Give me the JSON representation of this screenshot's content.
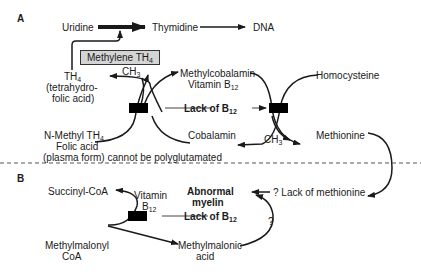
{
  "panel_a": {
    "label": "A",
    "uridine": "Uridine",
    "thymidine": "Thymidine",
    "dna": "DNA",
    "methylene_box": {
      "text": "Methylene TH",
      "sub": "4"
    },
    "th4": {
      "text": "TH",
      "sub": "4"
    },
    "th4_desc_1": "(tetrahydro-",
    "th4_desc_2": "folic acid)",
    "ch3_top": {
      "text": "CH",
      "sub": "3"
    },
    "methylcobalamin": "Methylcobalamin",
    "vitamin_b12": {
      "text": "Vitamin B",
      "sub": "12"
    },
    "homocysteine": "Homocysteine",
    "lack_b12": {
      "text": "Lack of B",
      "sub": "12"
    },
    "n_methyl": {
      "text": "N-Methyl TH",
      "sub": "4"
    },
    "folic_acid": "Folic acid",
    "plasma_form": "(plasma form) cannot be polyglutamated",
    "cobalamin": "Cobalamin",
    "ch3_bottom": {
      "text": "CH",
      "sub": "3"
    },
    "methionine": "Methionine"
  },
  "panel_b": {
    "label": "B",
    "succinyl_coa": "Succinyl-CoA",
    "vitamin": "Vitamin",
    "b12": {
      "text": "B",
      "sub": "12"
    },
    "abnormal": "Abnormal",
    "myelin": "myelin",
    "lack_methionine": "? Lack  of methionine",
    "lack_b12": {
      "text": "Lack of B",
      "sub": "12"
    },
    "question": "?",
    "methylmalonyl_1": "Methylmalonyl",
    "methylmalonyl_2": "CoA",
    "methylmalonic_1": "Methylmalonic",
    "methylmalonic_2": "acid"
  },
  "colors": {
    "ink": "#1a1a1a",
    "box_fill": "#d4d4d4",
    "block": "#000000"
  }
}
